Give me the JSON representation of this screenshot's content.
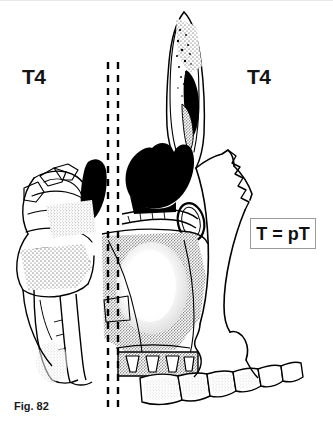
{
  "figure": {
    "caption": "Fig. 82",
    "background_color": "#ffffff",
    "ink_color": "#000000"
  },
  "labels": {
    "left_vertebra": "T4",
    "right_vertebra": "T4"
  },
  "formula": {
    "text": "T = pT",
    "border_color": "#9a9a9a"
  },
  "reference_lines": {
    "style": "dashed",
    "count": 2,
    "color": "#000000",
    "left_x": 108,
    "right_x": 118,
    "top_y": 62,
    "bottom_y": 412
  },
  "anatomy": {
    "regions": [
      "frontal-nasal-process",
      "nasal-bone",
      "ethmoid-air-cells",
      "sphenoid-sinus",
      "maxillary-sinus",
      "orbital-floor",
      "zygomatic-bone",
      "pterygoid-plates",
      "hard-palate",
      "maxillary-teeth",
      "mandibular-teeth"
    ]
  }
}
